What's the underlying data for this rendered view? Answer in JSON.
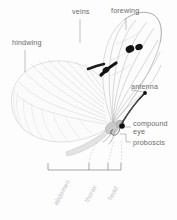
{
  "figure": {
    "background_color": "#fdfdfd",
    "label_color": "#6b6b6b",
    "faint_label_color": "#c2c2c2",
    "ink_color": "#1a1a1a",
    "wing_color": "#cfcfcf"
  },
  "labels": {
    "veins": "veins",
    "forewing": "forewing",
    "hindwing": "hindwing",
    "antenna": "antenna",
    "compound": "compound",
    "eye": "eye",
    "proboscis": "proboscis"
  },
  "body_segments": {
    "abdomen": "abdomen",
    "thorax": "thorax",
    "head": "head"
  }
}
